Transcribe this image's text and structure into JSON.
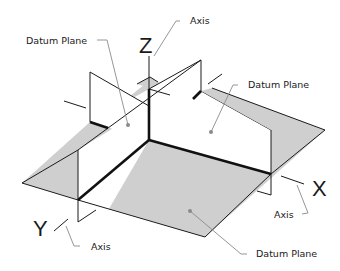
{
  "diagram": {
    "type": "isometric datum planes illustration",
    "colors": {
      "plane_fill": "#cfcfcf",
      "edge": "#1a1a1a",
      "leader": "#8a8a8a",
      "background": "#ffffff"
    },
    "labels": {
      "datum_plane_left": "Datum Plane",
      "datum_plane_right": "Datum Plane",
      "datum_plane_bottom": "Datum Plane",
      "axis_top": "Axis",
      "axis_right": "Axis",
      "axis_left": "Axis"
    },
    "axes": {
      "z": "Z",
      "x": "X",
      "y": "Y"
    }
  }
}
